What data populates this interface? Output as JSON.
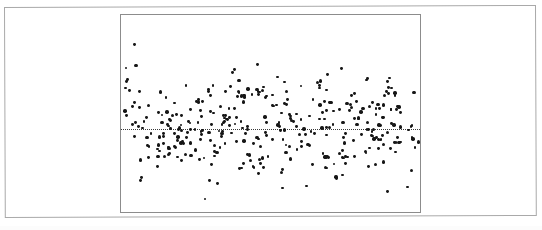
{
  "figure": {
    "width": 542,
    "height": 230,
    "background_color": "#ffffff",
    "outer_frame": {
      "name": "page-border",
      "x": 4,
      "y": 7,
      "width": 532,
      "height": 211,
      "color": "#a9a9a9",
      "skew_degrees": -0.22
    },
    "plot_box": {
      "x": 120,
      "y": 14,
      "width": 301,
      "height": 199,
      "border_color": "#8c8c8c"
    }
  },
  "chart_data": {
    "type": "scatter",
    "title": "",
    "subtitle": "",
    "xlabel": "",
    "ylabel": "",
    "grid": false,
    "legend": null,
    "tick_labels": {
      "x": [],
      "y": []
    },
    "axis_ranges": {
      "x": [
        0,
        1
      ],
      "y": [
        -1,
        1
      ]
    },
    "point_style": {
      "marker": "filled-circle",
      "color": "#161616",
      "diameter_px": 2.8
    },
    "reference_line": {
      "orientation": "horizontal",
      "value": 0,
      "pixel_y": 114,
      "style": "dotted",
      "color": "#3a3a3a",
      "label": ""
    },
    "n_points": 372,
    "generator": {
      "seed": 20250414,
      "x_distribution": "uniform",
      "x_range_px": [
        3,
        298
      ],
      "y_center_px": 114,
      "y_sigma_px": 27,
      "y_clip_px": [
        8,
        192
      ],
      "heavy_tail_fraction": 0.12,
      "heavy_tail_sigma_px": 52,
      "cluster_count": 26,
      "cluster_spread_px": 5.5
    }
  }
}
